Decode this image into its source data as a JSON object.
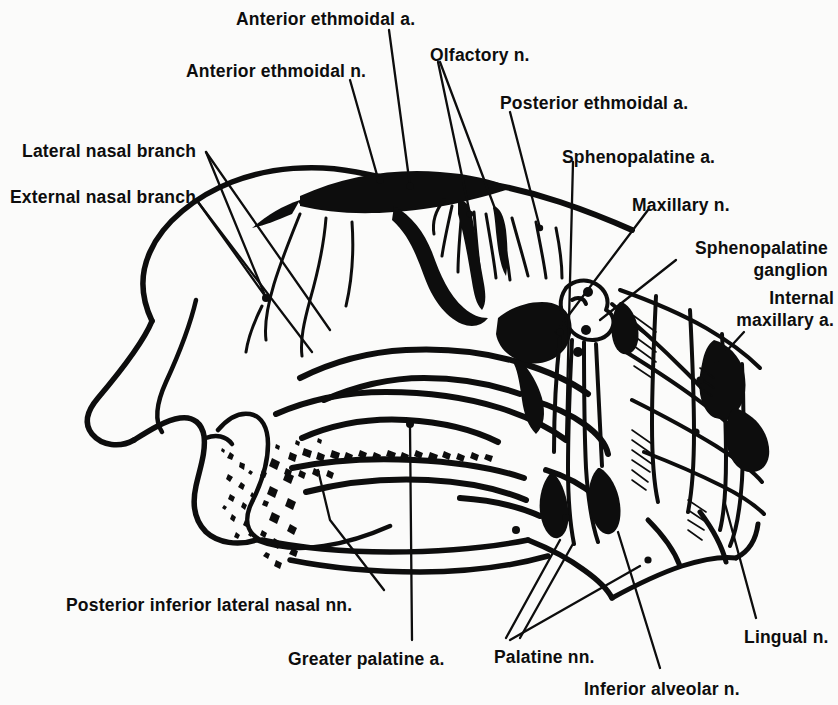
{
  "figure": {
    "type": "anatomical-illustration",
    "style": "black-and-white line drawing",
    "background_color": "#fbfbfa",
    "ink_color": "#0d0d0d",
    "canvas": {
      "width": 838,
      "height": 705
    }
  },
  "labels": [
    {
      "id": "anterior-ethmoidal-a",
      "text": "Anterior ethmoidal a.",
      "x": 236,
      "y": 8,
      "align": "left",
      "lines": 1
    },
    {
      "id": "anterior-ethmoidal-n",
      "text": "Anterior ethmoidal n.",
      "x": 186,
      "y": 60,
      "align": "left",
      "lines": 1
    },
    {
      "id": "olfactory-n",
      "text": "Olfactory n.",
      "x": 430,
      "y": 44,
      "align": "left",
      "lines": 1
    },
    {
      "id": "posterior-ethmoidal-a",
      "text": "Posterior ethmoidal a.",
      "x": 500,
      "y": 92,
      "align": "left",
      "lines": 1
    },
    {
      "id": "lateral-nasal-branch",
      "text": "Lateral nasal branch",
      "x": 22,
      "y": 140,
      "align": "left",
      "lines": 1
    },
    {
      "id": "sphenopalatine-a",
      "text": "Sphenopalatine a.",
      "x": 562,
      "y": 146,
      "align": "left",
      "lines": 1
    },
    {
      "id": "external-nasal-branch",
      "text": "External nasal branch",
      "x": 10,
      "y": 186,
      "align": "left",
      "lines": 1
    },
    {
      "id": "maxillary-n",
      "text": "Maxillary n.",
      "x": 632,
      "y": 194,
      "align": "left",
      "lines": 1
    },
    {
      "id": "sphenopalatine-ganglion",
      "text": "Sphenopalatine ganglion",
      "x": 676,
      "y": 238,
      "align": "right",
      "lines": 2,
      "width": 152
    },
    {
      "id": "internal-maxillary-a",
      "text": "Internal maxillary a.",
      "x": 720,
      "y": 288,
      "align": "right",
      "lines": 2,
      "width": 114
    },
    {
      "id": "posterior-inferior-lateral-nasal-nn",
      "text": "Posterior inferior lateral nasal nn.",
      "x": 66,
      "y": 594,
      "align": "left",
      "lines": 1
    },
    {
      "id": "lingual-n",
      "text": "Lingual n.",
      "x": 744,
      "y": 626,
      "align": "left",
      "lines": 1
    },
    {
      "id": "greater-palatine-a",
      "text": "Greater palatine a.",
      "x": 288,
      "y": 648,
      "align": "left",
      "lines": 1
    },
    {
      "id": "palatine-nn",
      "text": "Palatine nn.",
      "x": 494,
      "y": 646,
      "align": "left",
      "lines": 1
    },
    {
      "id": "inferior-alveolar-n",
      "text": "Inferior alveolar n.",
      "x": 584,
      "y": 678,
      "align": "left",
      "lines": 1
    }
  ],
  "structures": [
    {
      "id": "nasal-profile-outline",
      "name": "External nose and facial profile outline"
    },
    {
      "id": "nasal-cavity-roof",
      "name": "Roof of nasal cavity / cribriform plate region"
    },
    {
      "id": "superior-concha",
      "name": "Superior nasal concha"
    },
    {
      "id": "middle-concha",
      "name": "Middle nasal concha"
    },
    {
      "id": "inferior-concha",
      "name": "Inferior nasal concha"
    },
    {
      "id": "hard-palate",
      "name": "Hard palate"
    },
    {
      "id": "nasal-vestibule",
      "name": "Nasal vestibule and nostril"
    },
    {
      "id": "bone-stipple",
      "name": "Stippled cancellous bone texture"
    },
    {
      "id": "anterior-ethmoidal-artery",
      "name": "Anterior ethmoidal artery (heavy arching vessel)"
    },
    {
      "id": "olfactory-filaments",
      "name": "Olfactory nerve filaments descending from cribriform plate"
    },
    {
      "id": "ganglion-blob",
      "name": "Sphenopalatine ganglion (small lobulated body)"
    },
    {
      "id": "pterygopalatine-network",
      "name": "Pterygopalatine fossa vascular and nerve network"
    },
    {
      "id": "palatine-canal-nerves",
      "name": "Descending palatine nerves in the palatine canal"
    }
  ]
}
